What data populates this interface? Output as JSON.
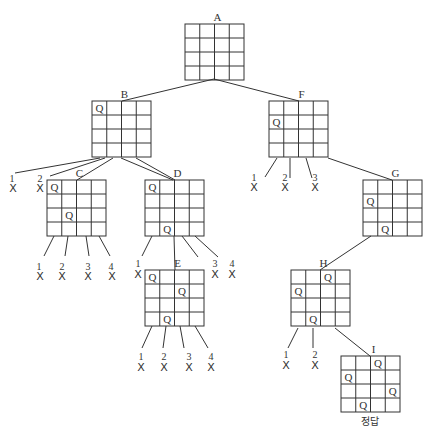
{
  "diagram": {
    "colors": {
      "line": "#333333",
      "text": "#333333",
      "background": "#ffffff"
    },
    "board_size": 4,
    "nodes": [
      {
        "id": "A",
        "label": "A",
        "x": 185,
        "y": 24,
        "queens": []
      },
      {
        "id": "B",
        "label": "B",
        "x": 92,
        "y": 101,
        "queens": [
          [
            0,
            0
          ]
        ]
      },
      {
        "id": "C",
        "label": "C",
        "x": 47,
        "y": 180,
        "queens": [
          [
            0,
            0
          ],
          [
            2,
            1
          ]
        ]
      },
      {
        "id": "D",
        "label": "D",
        "x": 145,
        "y": 180,
        "queens": [
          [
            0,
            0
          ],
          [
            3,
            1
          ]
        ]
      },
      {
        "id": "E",
        "label": "E",
        "x": 145,
        "y": 270,
        "queens": [
          [
            0,
            0
          ],
          [
            3,
            1
          ],
          [
            1,
            2
          ]
        ]
      },
      {
        "id": "F",
        "label": "F",
        "x": 269,
        "y": 101,
        "queens": [
          [
            1,
            0
          ]
        ]
      },
      {
        "id": "G",
        "label": "G",
        "x": 363,
        "y": 180,
        "queens": [
          [
            1,
            0
          ],
          [
            3,
            1
          ]
        ]
      },
      {
        "id": "H",
        "label": "H",
        "x": 291,
        "y": 270,
        "queens": [
          [
            1,
            0
          ],
          [
            3,
            1
          ],
          [
            0,
            2
          ]
        ]
      },
      {
        "id": "I",
        "label": "I",
        "x": 341,
        "y": 356,
        "queens": [
          [
            1,
            0
          ],
          [
            3,
            1
          ],
          [
            0,
            2
          ],
          [
            2,
            3
          ]
        ]
      }
    ],
    "edges": [
      {
        "from": [
          214,
          79
        ],
        "to": [
          122,
          101
        ]
      },
      {
        "from": [
          214,
          79
        ],
        "to": [
          299,
          101
        ]
      },
      {
        "from": [
          121,
          158
        ],
        "to": [
          173,
          180
        ]
      },
      {
        "from": [
          136,
          158
        ],
        "to": [
          175,
          180
        ]
      },
      {
        "from": [
          113,
          158
        ],
        "to": [
          77,
          180
        ]
      },
      {
        "from": [
          174,
          236
        ],
        "to": [
          175,
          270
        ]
      },
      {
        "from": [
          328,
          158
        ],
        "to": [
          392,
          180
        ]
      },
      {
        "from": [
          371,
          236
        ],
        "to": [
          320,
          270
        ]
      },
      {
        "from": [
          335,
          328
        ],
        "to": [
          370,
          356
        ]
      }
    ],
    "failed_leaves": [
      {
        "parent": "B",
        "from": [
          100,
          158
        ],
        "to": [
          15,
          173
        ],
        "num": "1",
        "nx": 12,
        "ny": 182,
        "xx": 13,
        "xy": 192
      },
      {
        "parent": "B",
        "from": [
          105,
          158
        ],
        "to": [
          50,
          176
        ],
        "num": "2",
        "nx": 40,
        "ny": 182,
        "xx": 40,
        "xy": 192
      },
      {
        "parent": "C",
        "from": [
          54,
          236
        ],
        "to": [
          44,
          256
        ],
        "num": "1",
        "nx": 39,
        "ny": 270,
        "xx": 40,
        "xy": 280
      },
      {
        "parent": "C",
        "from": [
          68,
          236
        ],
        "to": [
          65,
          256
        ],
        "num": "2",
        "nx": 62,
        "ny": 270,
        "xx": 62,
        "xy": 280
      },
      {
        "parent": "C",
        "from": [
          86,
          236
        ],
        "to": [
          89,
          256
        ],
        "num": "3",
        "nx": 88,
        "ny": 270,
        "xx": 88,
        "xy": 280
      },
      {
        "parent": "C",
        "from": [
          99,
          236
        ],
        "to": [
          110,
          256
        ],
        "num": "4",
        "nx": 111,
        "ny": 270,
        "xx": 112,
        "xy": 280
      },
      {
        "parent": "D",
        "from": [
          152,
          236
        ],
        "to": [
          142,
          256
        ],
        "num": "1",
        "nx": 138,
        "ny": 267,
        "xx": 138,
        "xy": 278
      },
      {
        "parent": "D",
        "from": [
          182,
          236
        ],
        "to": [
          198,
          257
        ],
        "num": "3",
        "nx": 215,
        "ny": 267,
        "xx": 215,
        "xy": 278
      },
      {
        "parent": "D",
        "from": [
          195,
          236
        ],
        "to": [
          218,
          257
        ],
        "num": "4",
        "nx": 232,
        "ny": 267,
        "xx": 232,
        "xy": 278
      },
      {
        "parent": "E",
        "from": [
          152,
          326
        ],
        "to": [
          142,
          348
        ],
        "num": "1",
        "nx": 141,
        "ny": 360,
        "xx": 141,
        "xy": 371
      },
      {
        "parent": "E",
        "from": [
          166,
          326
        ],
        "to": [
          163,
          348
        ],
        "num": "2",
        "nx": 164,
        "ny": 360,
        "xx": 164,
        "xy": 371
      },
      {
        "parent": "E",
        "from": [
          180,
          326
        ],
        "to": [
          184,
          348
        ],
        "num": "3",
        "nx": 189,
        "ny": 360,
        "xx": 189,
        "xy": 371
      },
      {
        "parent": "E",
        "from": [
          195,
          326
        ],
        "to": [
          208,
          348
        ],
        "num": "4",
        "nx": 211,
        "ny": 360,
        "xx": 211,
        "xy": 371
      },
      {
        "parent": "F",
        "from": [
          277,
          158
        ],
        "to": [
          265,
          177
        ],
        "num": "1",
        "nx": 254,
        "ny": 181,
        "xx": 254,
        "xy": 191
      },
      {
        "parent": "F",
        "from": [
          290,
          158
        ],
        "to": [
          290,
          178
        ],
        "num": "2",
        "nx": 285,
        "ny": 181,
        "xx": 285,
        "xy": 191
      },
      {
        "parent": "F",
        "from": [
          306,
          158
        ],
        "to": [
          312,
          178
        ],
        "num": "3",
        "nx": 315,
        "ny": 181,
        "xx": 315,
        "xy": 191
      },
      {
        "parent": "H",
        "from": [
          298,
          328
        ],
        "to": [
          288,
          348
        ],
        "num": "1",
        "nx": 286,
        "ny": 358,
        "xx": 286,
        "xy": 369
      },
      {
        "parent": "H",
        "from": [
          313,
          328
        ],
        "to": [
          313,
          348
        ],
        "num": "2",
        "nx": 315,
        "ny": 358,
        "xx": 315,
        "xy": 369
      }
    ],
    "failed_marker": "X",
    "answer_label": "정답",
    "answer_pos": {
      "x": 370,
      "y": 425
    }
  }
}
